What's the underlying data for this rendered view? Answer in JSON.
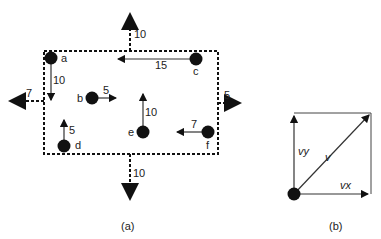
{
  "figure_a": {
    "caption": "(a)",
    "particles": [
      {
        "label": "a",
        "vector_value": "10",
        "direction": "down"
      },
      {
        "label": "b",
        "vector_value": "5",
        "direction": "right"
      },
      {
        "label": "c",
        "vector_value": "15",
        "direction": "left"
      },
      {
        "label": "d",
        "vector_value": "5",
        "direction": "up"
      },
      {
        "label": "e",
        "vector_value": "10",
        "direction": "up"
      },
      {
        "label": "f",
        "vector_value": "7",
        "direction": "left"
      }
    ],
    "net_vectors": {
      "top": "10",
      "bottom": "10",
      "left": "7",
      "right": "5"
    }
  },
  "figure_b": {
    "caption": "(b)",
    "labels": {
      "vy": "vy",
      "v": "v",
      "vx": "vx"
    }
  }
}
